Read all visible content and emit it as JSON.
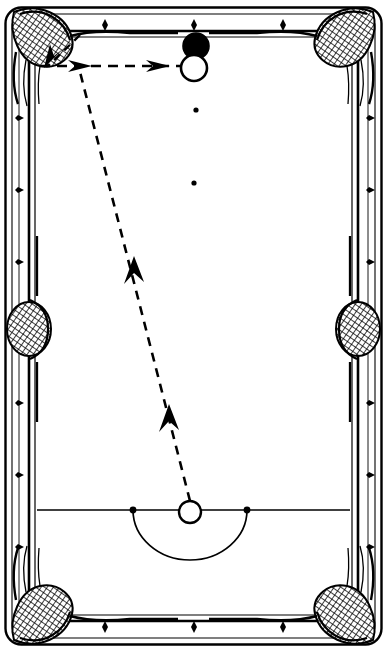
{
  "diagram": {
    "colors": {
      "line": "#000000",
      "cloth": "#ffffff",
      "rail": "#ffffff",
      "ball_black": "#000000",
      "ball_white": "#ffffff",
      "pocket_net": "#000000"
    },
    "table": {
      "outer": {
        "x": 4,
        "y": 6,
        "width": 379,
        "height": 640
      },
      "rail_inner": {
        "x": 30,
        "y": 30,
        "width": 327,
        "height": 592
      },
      "cloth": {
        "x": 37,
        "y": 37,
        "width": 313,
        "height": 578
      }
    },
    "balls": [
      {
        "name": "black-ball",
        "label": "black",
        "fill": "#000000",
        "cx": 196,
        "cy": 46,
        "r": 13
      },
      {
        "name": "cue-ball-top",
        "label": "cue ball at contact",
        "fill": "#ffffff",
        "cx": 194,
        "cy": 68,
        "r": 13
      },
      {
        "name": "cue-ball-start",
        "label": "cue ball in the D",
        "fill": "#ffffff",
        "cx": 190,
        "cy": 512,
        "r": 11
      }
    ],
    "table_spots": [
      {
        "name": "pink-spot",
        "cx": 196,
        "cy": 110,
        "r": 2.6
      },
      {
        "name": "centre-spot",
        "cx": 194,
        "cy": 183,
        "r": 2.6
      },
      {
        "name": "baulk-left-spot",
        "cx": 133,
        "cy": 510,
        "r": 3.4
      },
      {
        "name": "baulk-right-spot",
        "cx": 247,
        "cy": 510,
        "r": 3.4
      }
    ],
    "baulk": {
      "line_y": 510,
      "line_x1": 37,
      "line_x2": 350,
      "d_cx": 190,
      "d_rx": 57,
      "d_ry": 50
    },
    "paths": [
      {
        "name": "cue-path-long",
        "style": "dashed",
        "from": {
          "x": 190,
          "y": 501
        },
        "to": {
          "x": 80,
          "y": 72
        },
        "arrows": [
          {
            "x": 168,
            "y": 412,
            "angle": -76
          },
          {
            "x": 133,
            "y": 264,
            "angle": -76
          }
        ]
      },
      {
        "name": "object-ball-path",
        "style": "dashed",
        "from": {
          "x": 40,
          "y": 66
        },
        "to": {
          "x": 194,
          "y": 66
        },
        "arrows": [
          {
            "x": 86,
            "y": 66,
            "angle": 0
          },
          {
            "x": 162,
            "y": 66,
            "angle": 0
          }
        ]
      },
      {
        "name": "deflection-path",
        "style": "dashed",
        "from": {
          "x": 80,
          "y": 35
        },
        "to": {
          "x": 48,
          "y": 66
        },
        "arrows": [
          {
            "x": 56,
            "y": 58,
            "angle": 136
          }
        ]
      }
    ],
    "rail_markers": {
      "top": [
        105,
        194,
        283
      ],
      "bottom": [
        105,
        194,
        283
      ],
      "left": [
        115,
        187,
        259,
        400,
        472,
        544
      ],
      "right": [
        115,
        187,
        259,
        400,
        472,
        544
      ]
    },
    "pockets": [
      {
        "name": "pocket-top-left",
        "cx": 32,
        "cy": 33,
        "type": "corner"
      },
      {
        "name": "pocket-top-right",
        "cx": 355,
        "cy": 33,
        "type": "corner"
      },
      {
        "name": "pocket-middle-left",
        "cx": 27,
        "cy": 329,
        "type": "middle"
      },
      {
        "name": "pocket-middle-right",
        "cx": 360,
        "cy": 329,
        "type": "middle"
      },
      {
        "name": "pocket-bottom-left",
        "cx": 32,
        "cy": 619,
        "type": "corner"
      },
      {
        "name": "pocket-bottom-right",
        "cx": 355,
        "cy": 619,
        "type": "corner"
      }
    ]
  }
}
